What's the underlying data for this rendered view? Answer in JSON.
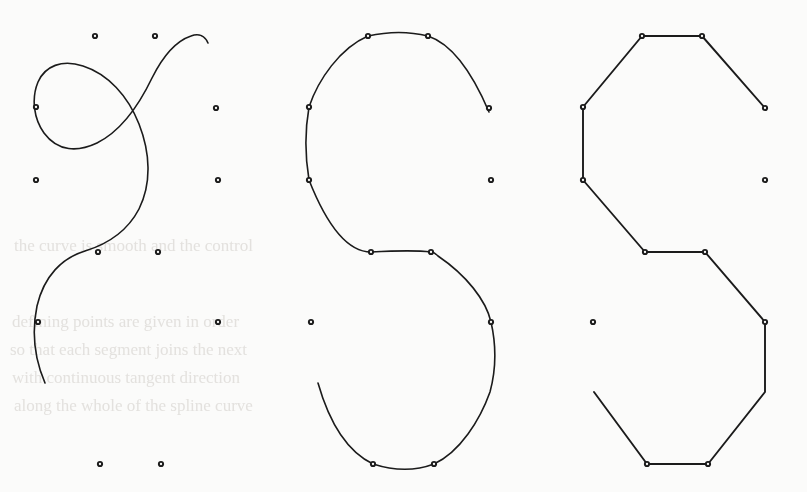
{
  "figure": {
    "background_color": "#fbfbfa",
    "ink_color": "#1b1b1b",
    "width": 807,
    "height": 492
  },
  "chart_data": {
    "type": "line",
    "title": "",
    "xlabel": "",
    "ylabel": "",
    "grid": false,
    "legend": "none",
    "xlim": [
      0,
      807
    ],
    "ylim": [
      0,
      492
    ],
    "shared_control_point_shape": {
      "name": "S-shape control points",
      "count": 12,
      "local_x": [
        95,
        155,
        36,
        216,
        36,
        218,
        98,
        158,
        38,
        218,
        100,
        161
      ],
      "local_y": [
        36,
        36,
        107,
        108,
        180,
        180,
        252,
        252,
        322,
        322,
        464,
        464
      ]
    },
    "panels": [
      {
        "name": "loose-spline-panel",
        "label": "",
        "index": 1,
        "offset_x": 0,
        "curve_style": "smooth-spline-approximating",
        "tension": "loose",
        "points": [
          {
            "id": "p1",
            "x": 95,
            "y": 36,
            "on_curve": false
          },
          {
            "id": "p2",
            "x": 155,
            "y": 36,
            "on_curve": false
          },
          {
            "id": "p3",
            "x": 36,
            "y": 107,
            "on_curve": false
          },
          {
            "id": "p4",
            "x": 216,
            "y": 108,
            "on_curve": false
          },
          {
            "id": "p5",
            "x": 36,
            "y": 180,
            "on_curve": false
          },
          {
            "id": "p6",
            "x": 218,
            "y": 180,
            "on_curve": false
          },
          {
            "id": "p7",
            "x": 98,
            "y": 252,
            "on_curve": false
          },
          {
            "id": "p8",
            "x": 158,
            "y": 252,
            "on_curve": false
          },
          {
            "id": "p9",
            "x": 38,
            "y": 322,
            "on_curve": false
          },
          {
            "id": "p10",
            "x": 218,
            "y": 322,
            "on_curve": false
          },
          {
            "id": "p11",
            "x": 100,
            "y": 464,
            "on_curve": false
          },
          {
            "id": "p12",
            "x": 161,
            "y": 464,
            "on_curve": false
          }
        ],
        "path": "M 45 383 C 33 355 32 330 37 306 C 44 276 62 258 85 251 C 108 244 128 230 139 209 C 152 183 150 152 139 124 C 128 96 108 74 83 66 C 62 59 45 66 38 82 C 31 99 34 119 44 133 C 58 152 78 152 97 143 C 123 130 140 103 152 78 C 163 56 176 41 191 36 C 199 33 205 36 208 43"
      },
      {
        "name": "tight-spline-panel",
        "label": "",
        "index": 2,
        "offset_x": 273,
        "curve_style": "smooth-spline-interpolating",
        "tension": "tight",
        "points": [
          {
            "id": "p1",
            "x": 368,
            "y": 36,
            "on_curve": true
          },
          {
            "id": "p2",
            "x": 428,
            "y": 36,
            "on_curve": true
          },
          {
            "id": "p3",
            "x": 309,
            "y": 107,
            "on_curve": true
          },
          {
            "id": "p4",
            "x": 489,
            "y": 108,
            "on_curve": true
          },
          {
            "id": "p5",
            "x": 309,
            "y": 180,
            "on_curve": true
          },
          {
            "id": "p6",
            "x": 491,
            "y": 180,
            "on_curve": false
          },
          {
            "id": "p7",
            "x": 371,
            "y": 252,
            "on_curve": true
          },
          {
            "id": "p8",
            "x": 431,
            "y": 252,
            "on_curve": true
          },
          {
            "id": "p9",
            "x": 311,
            "y": 322,
            "on_curve": false
          },
          {
            "id": "p10",
            "x": 491,
            "y": 322,
            "on_curve": true
          },
          {
            "id": "p11",
            "x": 373,
            "y": 464,
            "on_curve": true
          },
          {
            "id": "p12",
            "x": 434,
            "y": 464,
            "on_curve": true
          }
        ],
        "path": "M 318 383 C 330 425 348 452 373 464 C 398 472 418 470 434 464 C 460 452 480 420 490 392 C 497 366 496 344 491 322 C 486 300 466 275 438 256 C 435 253 433 252 431 252 C 415 250 390 251 371 252 C 345 252 324 218 309 180 C 305 156 305 130 309 107 C 318 80 340 48 368 36 C 390 31 412 32 428 36 C 452 44 472 72 489 112"
      },
      {
        "name": "control-polygon-panel",
        "label": "",
        "index": 3,
        "offset_x": 547,
        "curve_style": "straight-polyline",
        "tension": "none",
        "points": [
          {
            "id": "p1",
            "x": 642,
            "y": 36,
            "on_curve": true
          },
          {
            "id": "p2",
            "x": 702,
            "y": 36,
            "on_curve": true
          },
          {
            "id": "p3",
            "x": 583,
            "y": 107,
            "on_curve": true
          },
          {
            "id": "p4",
            "x": 765,
            "y": 108,
            "on_curve": true
          },
          {
            "id": "p5",
            "x": 583,
            "y": 180,
            "on_curve": true
          },
          {
            "id": "p6",
            "x": 765,
            "y": 180,
            "on_curve": false
          },
          {
            "id": "p7",
            "x": 645,
            "y": 252,
            "on_curve": true
          },
          {
            "id": "p8",
            "x": 705,
            "y": 252,
            "on_curve": true
          },
          {
            "id": "p9",
            "x": 593,
            "y": 322,
            "on_curve": false
          },
          {
            "id": "p10",
            "x": 765,
            "y": 322,
            "on_curve": true
          },
          {
            "id": "p11",
            "x": 647,
            "y": 464,
            "on_curve": true
          },
          {
            "id": "p12",
            "x": 708,
            "y": 464,
            "on_curve": true
          }
        ],
        "path": "M 594 392 L 647 464 L 708 464 L 765 392 L 765 322 L 705 252 L 645 252 L 583 180 L 583 107 L 642 36 L 702 36 L 765 108"
      }
    ]
  },
  "ghost_text": {
    "description": "Illegible faint bleed-through of text printed on the reverse side of the scanned page",
    "color": "#e3e1de",
    "lines": [
      {
        "text": "the curve is  smooth  and  the  control",
        "x": 14,
        "y": 236,
        "size": 17
      },
      {
        "text": "defining  points  are  given  in  order",
        "x": 12,
        "y": 312,
        "size": 17
      },
      {
        "text": "so  that  each  segment  joins  the  next",
        "x": 10,
        "y": 340,
        "size": 17
      },
      {
        "text": "with  continuous  tangent  direction",
        "x": 12,
        "y": 368,
        "size": 17
      },
      {
        "text": "along  the  whole  of  the  spline  curve",
        "x": 14,
        "y": 396,
        "size": 17
      }
    ]
  }
}
